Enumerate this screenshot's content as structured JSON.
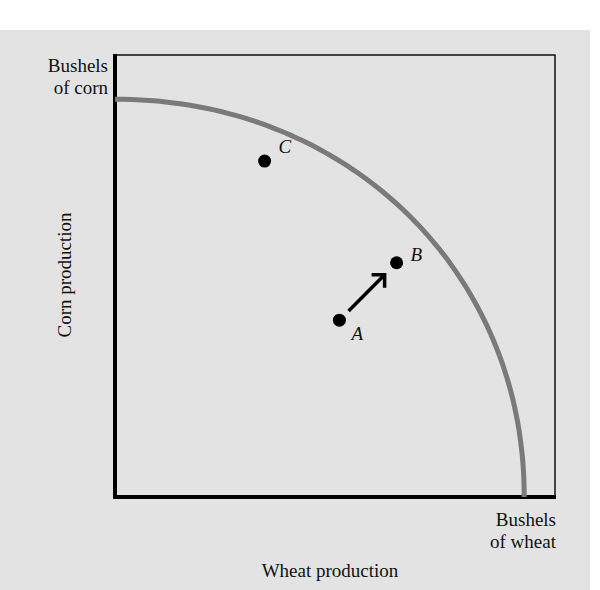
{
  "chart_data": {
    "type": "diagram",
    "xlabel": "Wheat production",
    "ylabel": "Corn production",
    "x_axis_end_label": [
      "Bushels",
      "of wheat"
    ],
    "y_axis_end_label": [
      "Bushels",
      "of corn"
    ],
    "xlim": [
      0,
      1
    ],
    "ylim": [
      0,
      1
    ],
    "grid": false,
    "curve": {
      "name": "frontier",
      "color": "#7a7a7a",
      "y_intercept": 0.9,
      "x_intercept": 0.93
    },
    "points": [
      {
        "label": "C",
        "x": 0.34,
        "y": 0.76,
        "on_curve": true
      },
      {
        "label": "B",
        "x": 0.64,
        "y": 0.53,
        "on_curve": true
      },
      {
        "label": "A",
        "x": 0.51,
        "y": 0.4,
        "on_curve": false
      }
    ],
    "arrow": {
      "from": "A",
      "to": "B",
      "description": "movement from inside the frontier to the frontier"
    }
  }
}
